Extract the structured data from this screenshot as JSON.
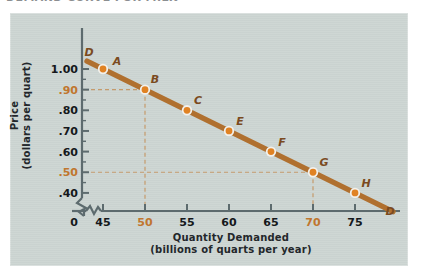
{
  "figure": {
    "clipped_title": "DEMAND CURVE FOR MILK",
    "panel_bg": "#ccd5d2",
    "curve_color": "#b0702f",
    "marker_color": "#e08223",
    "highlight_color": "#c0762e",
    "guide_color": "#c59b6c"
  },
  "chart_data": {
    "type": "line",
    "title": "",
    "xlabel": "Quantity Demanded",
    "xlabel_sub": "(billions of quarts per year)",
    "ylabel": "Price",
    "ylabel_sub": "(dollars per quart)",
    "xlim": [
      45,
      78
    ],
    "ylim": [
      0.38,
      1.04
    ],
    "x_origin_label": "0",
    "axis_break": true,
    "grid": false,
    "legend": null,
    "series_label": "D",
    "series_label_positions": [
      "left-top",
      "right-bottom"
    ],
    "x_ticks": [
      {
        "value": 45,
        "label": "45",
        "highlight": false
      },
      {
        "value": 50,
        "label": "50",
        "highlight": true
      },
      {
        "value": 55,
        "label": "55",
        "highlight": false
      },
      {
        "value": 60,
        "label": "60",
        "highlight": false
      },
      {
        "value": 65,
        "label": "65",
        "highlight": false
      },
      {
        "value": 70,
        "label": "70",
        "highlight": true
      },
      {
        "value": 75,
        "label": "75",
        "highlight": false
      }
    ],
    "y_ticks": [
      {
        "value": 1.0,
        "label": "1.00",
        "highlight": false
      },
      {
        "value": 0.9,
        "label": ".90",
        "highlight": true
      },
      {
        "value": 0.8,
        "label": ".80",
        "highlight": false
      },
      {
        "value": 0.7,
        "label": ".70",
        "highlight": false
      },
      {
        "value": 0.6,
        "label": ".60",
        "highlight": false
      },
      {
        "value": 0.5,
        "label": ".50",
        "highlight": true
      },
      {
        "value": 0.4,
        "label": ".40",
        "highlight": false
      }
    ],
    "points": [
      {
        "label": "A",
        "x": 45,
        "y": 1.0,
        "label_dx": 14,
        "label_dy": -8
      },
      {
        "label": "B",
        "x": 50,
        "y": 0.9,
        "label_dx": 10,
        "label_dy": -11
      },
      {
        "label": "C",
        "x": 55,
        "y": 0.8,
        "label_dx": 11,
        "label_dy": -10
      },
      {
        "label": "E",
        "x": 60,
        "y": 0.7,
        "label_dx": 11,
        "label_dy": -10
      },
      {
        "label": "F",
        "x": 65,
        "y": 0.6,
        "label_dx": 11,
        "label_dy": -10
      },
      {
        "label": "G",
        "x": 70,
        "y": 0.5,
        "label_dx": 11,
        "label_dy": -10
      },
      {
        "label": "H",
        "x": 75,
        "y": 0.4,
        "label_dx": 11,
        "label_dy": -10
      }
    ],
    "guide_lines": [
      {
        "from_point": "B",
        "x": 50,
        "y": 0.9
      },
      {
        "from_point": "G",
        "x": 70,
        "y": 0.5
      }
    ]
  }
}
